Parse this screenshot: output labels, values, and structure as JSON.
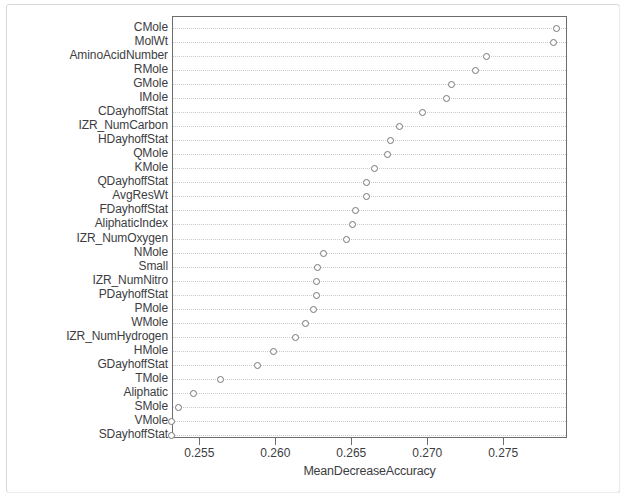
{
  "chart_data": {
    "type": "scatter",
    "title": "",
    "xlabel": "MeanDecreaseAccuracy",
    "ylabel": "",
    "xlim": [
      0.2532,
      0.2792
    ],
    "grid": true,
    "legend": null,
    "orientation": "horizontal-dotchart",
    "xticks": [
      0.255,
      0.26,
      0.265,
      0.27,
      0.275
    ],
    "xtick_labels": [
      "0.255",
      "0.260",
      "0.265",
      "0.270",
      "0.275"
    ],
    "categories": [
      "CMole",
      "MolWt",
      "AminoAcidNumber",
      "RMole",
      "GMole",
      "IMole",
      "CDayhoffStat",
      "IZR_NumCarbon",
      "HDayhoffStat",
      "QMole",
      "KMole",
      "QDayhoffStat",
      "AvgResWt",
      "FDayhoffStat",
      "AliphaticIndex",
      "IZR_NumOxygen",
      "NMole",
      "Small",
      "IZR_NumNitro",
      "PDayhoffStat",
      "PMole",
      "WMole",
      "IZR_NumHydrogen",
      "HMole",
      "GDayhoffStat",
      "TMole",
      "Aliphatic",
      "SMole",
      "VMole",
      "SDayhoffStat"
    ],
    "values": [
      0.2784,
      0.2782,
      0.2738,
      0.2731,
      0.2715,
      0.2712,
      0.2696,
      0.2681,
      0.2675,
      0.2673,
      0.2664,
      0.2659,
      0.2659,
      0.2652,
      0.265,
      0.2646,
      0.2631,
      0.2627,
      0.2626,
      0.2626,
      0.2624,
      0.2619,
      0.2612,
      0.2598,
      0.2587,
      0.2563,
      0.2545,
      0.2535,
      0.2531,
      0.2531
    ]
  },
  "axis": {
    "x_title": "MeanDecreaseAccuracy"
  },
  "colors": {
    "point_stroke": "#76767a",
    "grid": "#c9c9cc",
    "frame": "#6d6d70",
    "text": "#3d3d3f",
    "background": "#ffffff"
  }
}
